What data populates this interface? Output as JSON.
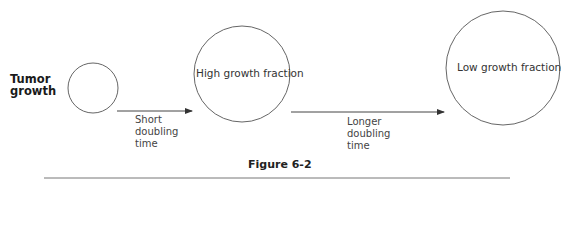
{
  "diagram": {
    "row_label": [
      "Tumor",
      "growth"
    ],
    "circles": [
      {
        "id": "small",
        "label": "",
        "cx": 93,
        "cy": 88,
        "r": 25
      },
      {
        "id": "medium",
        "label": "High growth fraction",
        "cx": 242,
        "cy": 74,
        "r": 48
      },
      {
        "id": "large",
        "label": "Low growth fraction",
        "cx": 503,
        "cy": 68,
        "r": 57
      }
    ],
    "arrows": [
      {
        "from": "small",
        "to": "medium",
        "label": [
          "Short",
          "doubling",
          "time"
        ]
      },
      {
        "from": "medium",
        "to": "large",
        "label": [
          "Longer",
          "doubling",
          "time"
        ]
      }
    ],
    "caption": "Figure 6-2",
    "colors": {
      "stroke": "#555555",
      "text": "#2a2a2a"
    }
  }
}
